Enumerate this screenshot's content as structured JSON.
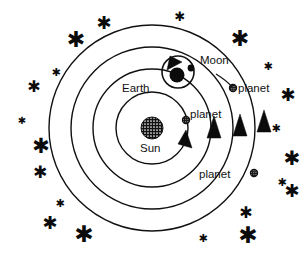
{
  "diagram": {
    "background_color": "#ffffff",
    "stroke_color": "#111111",
    "body_fill_color": "#0b0b0b",
    "labels": {
      "sun": "Sun",
      "earth": "Earth",
      "moon": "Moon",
      "planet_inner": "planet",
      "planet_upper_right": "planet",
      "planet_lower_right": "planet"
    },
    "bodies": [
      {
        "name": "Sun",
        "label": "Sun",
        "cx": 152,
        "cy": 128,
        "r": 11,
        "style": "hatched-circle"
      },
      {
        "name": "Earth",
        "label": "Earth",
        "cx": 176,
        "cy": 74,
        "r": 7,
        "style": "filled-circle"
      },
      {
        "name": "Moon",
        "label": "Moon",
        "cx": 190,
        "cy": 68,
        "r": 3.2,
        "style": "filled-circle"
      },
      {
        "name": "planet-inner",
        "label": "planet",
        "cx": 186,
        "cy": 120,
        "r": 3.4,
        "style": "hatched-dot"
      },
      {
        "name": "planet-upper-right",
        "label": "planet",
        "cx": 233,
        "cy": 88,
        "r": 3.4,
        "style": "hatched-dot"
      },
      {
        "name": "planet-lower-right",
        "label": "planet",
        "cx": 254,
        "cy": 173,
        "r": 3.4,
        "style": "hatched-dot"
      }
    ],
    "orbits": [
      {
        "name": "orbit-1-inner",
        "cx": 152,
        "cy": 128,
        "r": 36
      },
      {
        "name": "orbit-2-earth",
        "cx": 152,
        "cy": 128,
        "r": 59
      },
      {
        "name": "orbit-3",
        "cx": 152,
        "cy": 128,
        "r": 81
      },
      {
        "name": "orbit-4-outer",
        "cx": 152,
        "cy": 128,
        "r": 103
      },
      {
        "name": "moon-orbit",
        "cx": 178,
        "cy": 72,
        "r": 16
      }
    ],
    "direction_arrows": [
      {
        "name": "arrow-orbit-1",
        "x": 184,
        "y": 142,
        "angle": -22
      },
      {
        "name": "arrow-orbit-2",
        "x": 214,
        "y": 130,
        "angle": -12
      },
      {
        "name": "arrow-orbit-3",
        "x": 240,
        "y": 128,
        "angle": -8
      },
      {
        "name": "arrow-orbit-4",
        "x": 264,
        "y": 124,
        "angle": -5
      },
      {
        "name": "arrow-moon-orbit",
        "x": 171,
        "y": 60,
        "angle": -55
      }
    ],
    "stars": [
      {
        "x": 104,
        "y": 22,
        "size": 18
      },
      {
        "x": 76,
        "y": 39,
        "size": 22
      },
      {
        "x": 180,
        "y": 16,
        "size": 13
      },
      {
        "x": 240,
        "y": 38,
        "size": 22
      },
      {
        "x": 56,
        "y": 72,
        "size": 11
      },
      {
        "x": 34,
        "y": 86,
        "size": 16
      },
      {
        "x": 268,
        "y": 66,
        "size": 11
      },
      {
        "x": 288,
        "y": 94,
        "size": 18
      },
      {
        "x": 22,
        "y": 120,
        "size": 10
      },
      {
        "x": 41,
        "y": 146,
        "size": 21
      },
      {
        "x": 276,
        "y": 128,
        "size": 11
      },
      {
        "x": 40,
        "y": 172,
        "size": 17
      },
      {
        "x": 292,
        "y": 158,
        "size": 20
      },
      {
        "x": 60,
        "y": 203,
        "size": 11
      },
      {
        "x": 282,
        "y": 182,
        "size": 11
      },
      {
        "x": 292,
        "y": 190,
        "size": 18
      },
      {
        "x": 50,
        "y": 222,
        "size": 18
      },
      {
        "x": 84,
        "y": 234,
        "size": 23
      },
      {
        "x": 246,
        "y": 212,
        "size": 16
      },
      {
        "x": 248,
        "y": 235,
        "size": 23
      },
      {
        "x": 203,
        "y": 238,
        "size": 11
      }
    ]
  }
}
